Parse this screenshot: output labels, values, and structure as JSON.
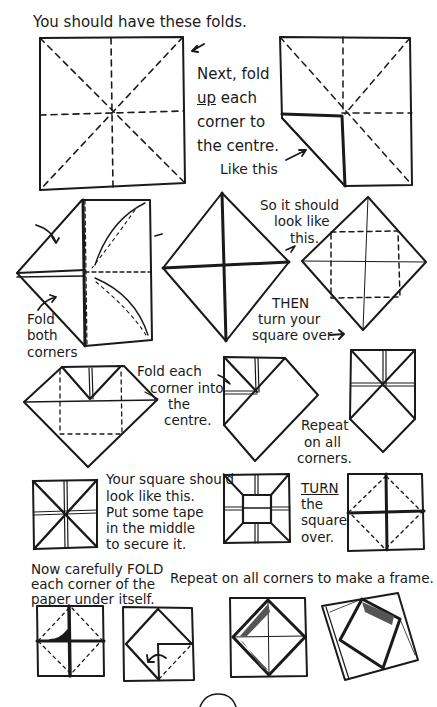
{
  "title": "You should have these folds.",
  "step_next": [
    "Next, fold",
    "up each",
    "corner to",
    "the centre."
  ],
  "step_next_underlined_word": "up",
  "like_this": "Like this",
  "fold_both_corners": [
    "Fold",
    "both",
    "corners"
  ],
  "so_it_should": [
    "So it should",
    "look like",
    "this."
  ],
  "then_turn": [
    "THEN",
    "turn your",
    "square over."
  ],
  "fold_each_corner": [
    "Fold each",
    "corner into",
    "the",
    "centre."
  ],
  "repeat_on_all": [
    "Repeat",
    "on all",
    "corners."
  ],
  "your_square": [
    "Your square should",
    "look like this.",
    "Put some tape",
    "in the middle",
    "to secure it."
  ],
  "turn_square": [
    "TURN",
    "the",
    "square",
    "over."
  ],
  "now_carefully": [
    "Now carefully FOLD",
    "each corner of the",
    "paper under itself."
  ],
  "repeat_frame": "Repeat on all corners to make a frame.",
  "colors": {
    "ink": "#1a1a1a",
    "background": "#ffffff"
  }
}
